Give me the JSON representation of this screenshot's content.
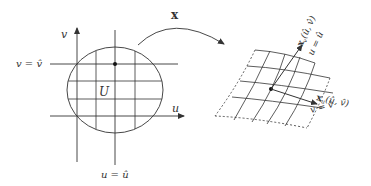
{
  "diagram": {
    "domain_region": {
      "label": "U",
      "axes": {
        "horizontal": "u",
        "vertical": "v"
      },
      "coordinate_lines": {
        "fixed_v": "v = v̂",
        "fixed_u": "u = û"
      }
    },
    "map": {
      "label": "x"
    },
    "surface": {
      "tangent_v_label": "x",
      "tangent_v_sub": "v",
      "tangent_v_args": "(û, v̂)",
      "tangent_u_label": "x",
      "tangent_u_sub": "u",
      "tangent_u_args": "(û, v̂)",
      "curve_u_label": "u = û",
      "curve_v_label": "v = v̂"
    },
    "colors": {
      "line": "#333333",
      "background": "#ffffff"
    }
  }
}
